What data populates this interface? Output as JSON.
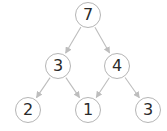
{
  "diagram": {
    "type": "tree",
    "colors": {
      "node_border": "#b5b5b5",
      "node_fill": "#ffffff",
      "edge": "#bdbdbd",
      "text": "#2a2a2a"
    },
    "nodes": [
      {
        "id": "n7",
        "label": "7",
        "x": 88,
        "y": 15
      },
      {
        "id": "n3a",
        "label": "3",
        "x": 58,
        "y": 66
      },
      {
        "id": "n4",
        "label": "4",
        "x": 117,
        "y": 66
      },
      {
        "id": "n2",
        "label": "2",
        "x": 28,
        "y": 110
      },
      {
        "id": "n1",
        "label": "1",
        "x": 88,
        "y": 110
      },
      {
        "id": "n3b",
        "label": "3",
        "x": 148,
        "y": 110
      }
    ],
    "edges": [
      {
        "from": "n7",
        "to": "n3a"
      },
      {
        "from": "n7",
        "to": "n4"
      },
      {
        "from": "n3a",
        "to": "n2"
      },
      {
        "from": "n3a",
        "to": "n1"
      },
      {
        "from": "n4",
        "to": "n1"
      },
      {
        "from": "n4",
        "to": "n3b"
      }
    ]
  }
}
